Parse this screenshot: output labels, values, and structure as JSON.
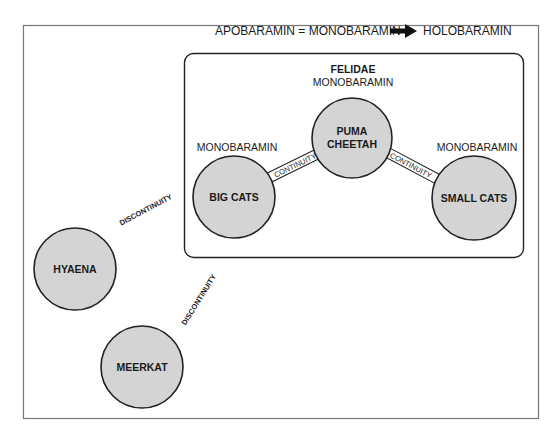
{
  "header": {
    "left": "APOBARAMIN = MONOBARAMIN",
    "arrow": "right-arrow",
    "right": "HOLOBARAMIN"
  },
  "group": {
    "title": "FELIDAE"
  },
  "nodes": {
    "puma": {
      "line1": "PUMA",
      "line2": "CHEETAH",
      "tag": "MONOBARAMIN"
    },
    "bigcats": {
      "label": "BIG CATS",
      "tag": "MONOBARAMIN"
    },
    "smallcats": {
      "label": "SMALL CATS",
      "tag": "MONOBARAMIN"
    },
    "hyaena": {
      "label": "HYAENA"
    },
    "meerkat": {
      "label": "MEERKAT"
    }
  },
  "edges": {
    "continuity_left": "CONTINUITY",
    "continuity_right": "CONTINUITY",
    "discontinuity_upper": "DISCONTINUITY",
    "discontinuity_lower": "DISCONTINUITY"
  },
  "colors": {
    "node_fill": "#d4d4d4",
    "stroke": "#222222"
  }
}
